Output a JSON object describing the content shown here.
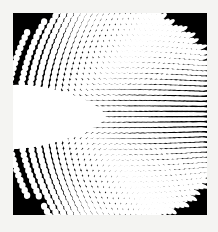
{
  "image": {
    "subject": "warped halftone dot grid (op-art moire pattern)",
    "colors": {
      "background": "#f4f4f2",
      "frame_fill": "#000000",
      "dots": "#ffffff",
      "void": "#ffffff"
    },
    "pattern": {
      "grid_rows": 30,
      "grid_cols": 30,
      "features": [
        "white wedge void on left-center",
        "dots stretch into ellipses toward right",
        "rounded black corners at top-left, top-right, bottom-right"
      ]
    }
  }
}
